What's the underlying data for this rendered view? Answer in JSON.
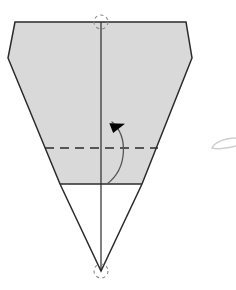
{
  "document": {
    "title": "Origami Fold Diagram",
    "background_color": "#ffffff",
    "width": 236,
    "height": 290
  },
  "palette": {
    "paper_fill": "#d9d9d9",
    "paper_fill_white": "#ffffff",
    "edge_stroke": "#2b2b2b",
    "crease_stroke": "#2b2b2b",
    "arrow_stroke": "#555555",
    "arrow_fill": "#000000",
    "marker_stroke": "#8a8a8a",
    "ghost_stroke": "#cfcfcf"
  },
  "figure": {
    "name": "kite-fold-step",
    "outline_points": "15,22 8,58 60,184 101,271 142,184 192,58 186,22",
    "gray_region_points": "15,22 8,58 60,184 142,184 192,58 186,22",
    "white_region_points": "60,184 142,184 101,271",
    "top_edge": {
      "label": "top-edge",
      "x1": 15,
      "y1": 22,
      "x2": 186,
      "y2": 22
    },
    "bevel_left": {
      "label": "left-bevel-edge",
      "x1": 15,
      "y1": 22,
      "x2": 8,
      "y2": 58
    },
    "bevel_right": {
      "label": "right-bevel-edge",
      "x1": 186,
      "y1": 22,
      "x2": 192,
      "y2": 58
    },
    "side_left": {
      "label": "left-taper-edge",
      "x1": 8,
      "y1": 58,
      "x2": 101,
      "y2": 271
    },
    "side_right": {
      "label": "right-taper-edge",
      "x1": 192,
      "y1": 58,
      "x2": 101,
      "y2": 271
    }
  },
  "creases": {
    "center_line": {
      "label": "center-vertical-crease",
      "style": "solid",
      "x1": 101,
      "y1": 22,
      "x2": 101,
      "y2": 271
    },
    "dashed_line": {
      "label": "horizontal-valley-fold",
      "style": "dashed",
      "dash_pattern": "9 6",
      "x1": 45,
      "y1": 148,
      "x2": 158,
      "y2": 148
    },
    "solid_line": {
      "label": "horizontal-edge-crease",
      "style": "solid",
      "x1": 60,
      "y1": 184,
      "x2": 142,
      "y2": 184
    }
  },
  "markers": [
    {
      "label": "top-pivot-marker",
      "shape": "dashed-circle",
      "cx": 101,
      "cy": 22,
      "r": 7
    },
    {
      "label": "bottom-pivot-marker",
      "shape": "dashed-circle",
      "cx": 101,
      "cy": 271,
      "r": 7
    }
  ],
  "arrow": {
    "label": "fold-direction-arrow",
    "path": "M 107,184 C 128,168 128,136 112,122",
    "head_points": "112,121 124,131 109,131",
    "head_rotation_deg": -38,
    "direction": "upward-curving",
    "meaning": "fold flap upward"
  },
  "ghost_mark": {
    "label": "ghost-curve-right",
    "path": "M 236,138 C 224,138 214,143 212,148 C 218,150 228,148 236,146",
    "visible": true
  },
  "annotations": {
    "alt_text": "Origami diagram showing a tapered paper shape with a center crease, a dashed horizontal valley fold, and a curved arrow indicating an upward fold.",
    "caption": ""
  }
}
